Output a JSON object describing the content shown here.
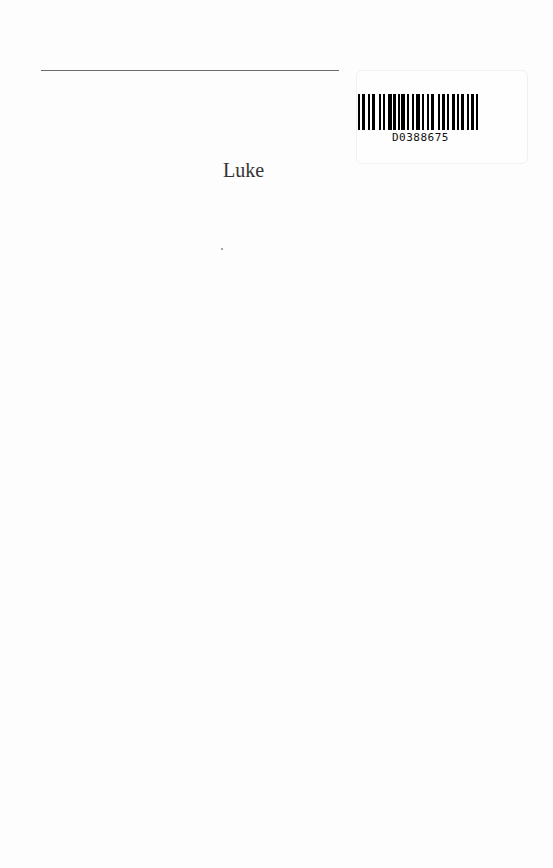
{
  "page": {
    "title": "Luke",
    "barcode_number": "D0388675"
  }
}
